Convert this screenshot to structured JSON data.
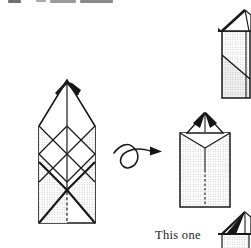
{
  "canvas": {
    "width": 251,
    "height": 248,
    "background": "#ffffff"
  },
  "colors": {
    "line": "#1a1a1a",
    "halftone_dot": "#c4c4c4",
    "dark_fill": "#151515",
    "caption_text": "#1d1d1d"
  },
  "clipped_heading": {
    "present": true,
    "legible": false
  },
  "caption": {
    "this_one_label": "This one"
  },
  "figures": {
    "left_figure": "origami-crease-pattern-diagram",
    "turn_arrow": "turn-over-curl-arrow-icon",
    "middle_figure": "origami-folded-front-diagram",
    "top_right_figure": "origami-folded-side-diagram",
    "bottom_right_figure": "origami-result-thumbnail"
  }
}
